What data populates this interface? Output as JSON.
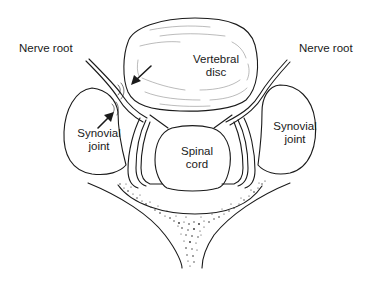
{
  "diagram": {
    "type": "anatomical-cross-section",
    "colors": {
      "stroke": "#1a1a1a",
      "background": "#ffffff",
      "stipple": "#2a2a2a"
    },
    "labels": {
      "nerve_root_left": "Nerve root",
      "nerve_root_right": "Nerve root",
      "vertebral_disc": {
        "line1": "Vertebral",
        "line2": "disc"
      },
      "synovial_joint_left": {
        "line1": "Synovial",
        "line2": "joint"
      },
      "synovial_joint_right": {
        "line1": "Synovial",
        "line2": "joint"
      },
      "spinal_cord": {
        "line1": "Spinal",
        "line2": "cord"
      }
    },
    "annotations": [
      {
        "type": "arrow",
        "points_to": "disc-nerve-root-compression"
      },
      {
        "type": "arrow",
        "points_to": "synovial-joint-nerve-root-compression"
      }
    ]
  }
}
